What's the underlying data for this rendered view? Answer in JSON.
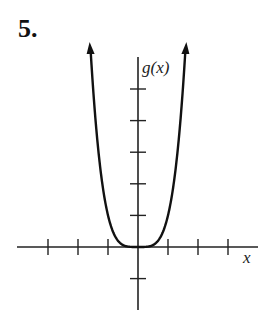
{
  "problem_number": "5.",
  "chart_data": {
    "type": "line",
    "title": "",
    "xlabel": "x",
    "ylabel": "g(x)",
    "function": "g(x) = x^4",
    "x_ticks": [
      -3,
      -2,
      -1,
      0,
      1,
      2,
      3
    ],
    "y_ticks": [
      -1,
      1,
      2,
      3,
      4,
      5
    ],
    "xlim": [
      -4,
      4
    ],
    "ylim": [
      -2,
      6
    ],
    "grid": false,
    "legend": null,
    "series": [
      {
        "name": "g(x)",
        "x": [
          -1.6,
          -1.5,
          -1,
          -0.5,
          0,
          0.5,
          1,
          1.5,
          1.6
        ],
        "values": [
          6.55,
          5.06,
          1,
          0.06,
          0,
          0.06,
          1,
          5.06,
          6.55
        ]
      }
    ],
    "annotations": [
      "arrows at both curve ends indicating continuation upward"
    ]
  },
  "colors": {
    "curve": "#111111",
    "axes": "#222222"
  }
}
